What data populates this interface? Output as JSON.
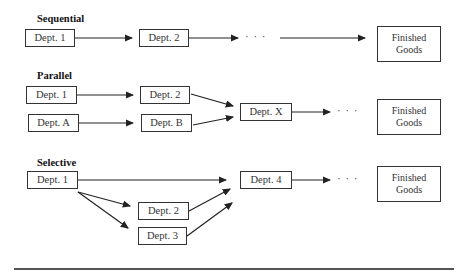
{
  "sections": {
    "sequential": {
      "title": "Sequential",
      "boxes": [
        "Dept. 1",
        "Dept. 2"
      ],
      "ellipsis": "· · ·",
      "end": "Finished Goods"
    },
    "parallel": {
      "title": "Parallel",
      "boxes": [
        "Dept. 1",
        "Dept. 2",
        "Dept. A",
        "Dept. B",
        "Dept. X"
      ],
      "ellipsis": "· · ·",
      "end": "Finished Goods"
    },
    "selective": {
      "title": "Selective",
      "boxes": [
        "Dept. 1",
        "Dept. 2",
        "Dept. 3",
        "Dept. 4"
      ],
      "ellipsis": "· · ·",
      "end": "Finished Goods"
    }
  },
  "colors": {
    "line": "#222222",
    "box_border": "#333333",
    "text": "#333333"
  }
}
